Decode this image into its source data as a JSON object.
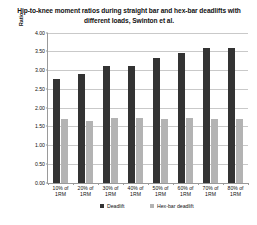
{
  "chart_data": {
    "type": "bar",
    "title": "Hip-to-knee moment ratios during straight bar and hex-bar deadlifts with different loads, Swinton et al.",
    "xlabel": "",
    "ylabel": "Ratio",
    "categories": [
      "10% of 1RM",
      "20% of 1RM",
      "30% of 1RM",
      "40% of 1RM",
      "50% of 1RM",
      "60% of 1RM",
      "70% of 1RM",
      "80% of 1RM"
    ],
    "series": [
      {
        "name": "Deadlift",
        "color": "#333333",
        "values": [
          2.75,
          2.9,
          3.12,
          3.1,
          3.32,
          3.45,
          3.58,
          3.58
        ]
      },
      {
        "name": "Hex-bar deadlift",
        "color": "#b3b3b3",
        "values": [
          1.7,
          1.65,
          1.72,
          1.72,
          1.7,
          1.72,
          1.7,
          1.7
        ]
      }
    ],
    "ylim": [
      0.0,
      4.0
    ],
    "ytick_labels": [
      "0.00",
      "0.50",
      "1.00",
      "1.50",
      "2.00",
      "2.50",
      "3.00",
      "3.50",
      "4.00"
    ],
    "ytick_values": [
      0.0,
      0.5,
      1.0,
      1.5,
      2.0,
      2.5,
      3.0,
      3.5,
      4.0
    ],
    "grid": true,
    "legend_position": "bottom"
  }
}
